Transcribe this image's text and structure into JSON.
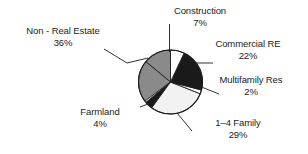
{
  "chart_data": {
    "type": "pie",
    "title": "",
    "subtitle": "",
    "xlabel": "",
    "ylabel": "",
    "legend_position": "none",
    "grid": false,
    "labels_show_percent": true,
    "start_angle_deg": 0,
    "direction": "clockwise",
    "categories": [
      "Construction",
      "Commercial RE",
      "Multifamily Res",
      "1–4 Family",
      "Farmland",
      "Non - Real Estate"
    ],
    "values": [
      7,
      22,
      2,
      29,
      4,
      36
    ],
    "slices": [
      {
        "label": "Construction",
        "value": 7,
        "percent_text": "7%",
        "color": "#ffffff",
        "start_deg": 0,
        "end_deg": 25.2
      },
      {
        "label": "Commercial RE",
        "value": 22,
        "percent_text": "22%",
        "color": "#1a1a1a",
        "start_deg": 25.2,
        "end_deg": 104.4
      },
      {
        "label": "Multifamily Res",
        "value": 2,
        "percent_text": "2%",
        "color": "#ffffff",
        "start_deg": 104.4,
        "end_deg": 111.6
      },
      {
        "label": "1–4 Family",
        "value": 29,
        "percent_text": "29%",
        "color": "#f2f2f2",
        "start_deg": 111.6,
        "end_deg": 216.0
      },
      {
        "label": "Farmland",
        "value": 4,
        "percent_text": "4%",
        "color": "#1a1a1a",
        "start_deg": 216.0,
        "end_deg": 230.4
      },
      {
        "label": "Non - Real Estate",
        "value": 36,
        "percent_text": "36%",
        "color": "#8a8a8a",
        "start_deg": 230.4,
        "end_deg": 360.0
      }
    ]
  },
  "labels": {
    "non_real_estate": {
      "name": "Non - Real Estate",
      "percent": "36%"
    },
    "construction": {
      "name": "Construction",
      "percent": "7%"
    },
    "commercial_re": {
      "name": "Commercial RE",
      "percent": "22%"
    },
    "multifamily_res": {
      "name": "Multifamily Res",
      "percent": "2%"
    },
    "one_to_four_family": {
      "name": "1–4 Family",
      "percent": "29%"
    },
    "farmland": {
      "name": "Farmland",
      "percent": "4%"
    }
  },
  "colors": {
    "dark_slice": "#1a1a1a",
    "gray_slice": "#8a8a8a",
    "light_slice": "#f2f2f2",
    "white_slice": "#ffffff",
    "outline": "#1c1c1c",
    "text": "#1c1c1c",
    "background": "#ffffff"
  }
}
